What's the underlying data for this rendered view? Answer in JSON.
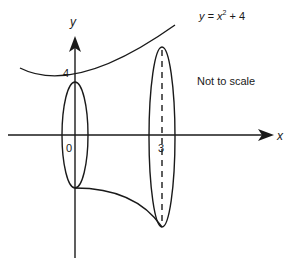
{
  "diagram": {
    "curve_label_prefix": "y = x",
    "curve_label_exp": "2",
    "curve_label_suffix": " + 4",
    "y_axis_label": "y",
    "x_axis_label": "x",
    "y_intercept_label": "4",
    "origin_label": "0",
    "x_mark_label": "3",
    "note": "Not to scale",
    "stroke_color": "#1a1a1a",
    "background": "#ffffff"
  }
}
